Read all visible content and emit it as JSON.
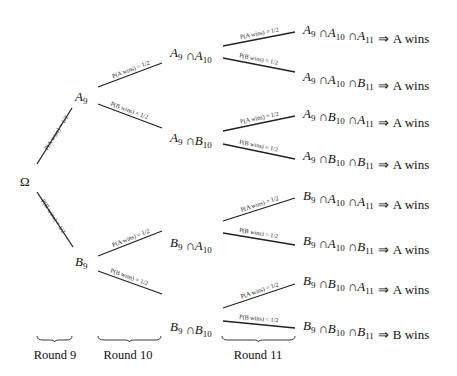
{
  "diagram": {
    "type": "probability-tree",
    "root": {
      "label": "Ω"
    },
    "level1": [
      {
        "id": "A9",
        "base": "A",
        "sub": "9"
      },
      {
        "id": "B9",
        "base": "B",
        "sub": "9"
      }
    ],
    "level2": [
      {
        "id": "A9A10",
        "parts": [
          [
            "A",
            "9"
          ],
          [
            "A",
            "10"
          ]
        ]
      },
      {
        "id": "A9B10",
        "parts": [
          [
            "A",
            "9"
          ],
          [
            "B",
            "10"
          ]
        ]
      },
      {
        "id": "B9A10",
        "parts": [
          [
            "B",
            "9"
          ],
          [
            "A",
            "10"
          ]
        ]
      },
      {
        "id": "B9B10",
        "parts": [
          [
            "B",
            "9"
          ],
          [
            "B",
            "10"
          ]
        ]
      }
    ],
    "leaves": [
      {
        "parts": [
          [
            "A",
            "9"
          ],
          [
            "A",
            "10"
          ],
          [
            "A",
            "11"
          ]
        ],
        "outcome": "A wins"
      },
      {
        "parts": [
          [
            "A",
            "9"
          ],
          [
            "A",
            "10"
          ],
          [
            "B",
            "11"
          ]
        ],
        "outcome": "A wins"
      },
      {
        "parts": [
          [
            "A",
            "9"
          ],
          [
            "B",
            "10"
          ],
          [
            "A",
            "11"
          ]
        ],
        "outcome": "A wins"
      },
      {
        "parts": [
          [
            "A",
            "9"
          ],
          [
            "B",
            "10"
          ],
          [
            "B",
            "11"
          ]
        ],
        "outcome": "A wins"
      },
      {
        "parts": [
          [
            "B",
            "9"
          ],
          [
            "A",
            "10"
          ],
          [
            "A",
            "11"
          ]
        ],
        "outcome": "A wins"
      },
      {
        "parts": [
          [
            "B",
            "9"
          ],
          [
            "A",
            "10"
          ],
          [
            "B",
            "11"
          ]
        ],
        "outcome": "A wins"
      },
      {
        "parts": [
          [
            "B",
            "9"
          ],
          [
            "B",
            "10"
          ],
          [
            "A",
            "11"
          ]
        ],
        "outcome": "A wins"
      },
      {
        "parts": [
          [
            "B",
            "9"
          ],
          [
            "B",
            "10"
          ],
          [
            "B",
            "11"
          ]
        ],
        "outcome": "B wins"
      }
    ],
    "edge_labels": {
      "a_wins": "P(A wins) = 1/2",
      "b_wins": "P(B wins) = 1/2"
    },
    "symbols": {
      "cap": "∩",
      "implies": "⇒"
    },
    "rounds": [
      "Round 9",
      "Round 10",
      "Round 11"
    ]
  }
}
